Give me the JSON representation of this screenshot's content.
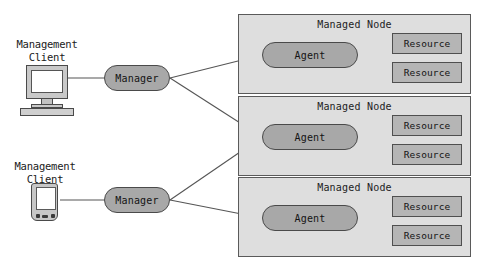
{
  "diagram": {
    "colors": {
      "node_fill": "#dedede",
      "node_border": "#5a5a5a",
      "pill_fill": "#a8a8a8",
      "pill_border": "#4a4a4a",
      "resource_fill": "#b5b5b5",
      "resource_border": "#4f4f4f",
      "line": "#555555",
      "text": "#141414",
      "background": "#ffffff"
    },
    "clients": [
      {
        "id": "management-client-desktop",
        "label": "Management\nClient",
        "device": "desktop-computer-icon"
      },
      {
        "id": "management-client-handheld",
        "label": "Management\nClient",
        "device": "pda-handheld-icon"
      }
    ],
    "managers": [
      {
        "id": "manager-top",
        "label": "Manager"
      },
      {
        "id": "manager-bottom",
        "label": "Manager"
      }
    ],
    "managed_nodes": [
      {
        "id": "managed-node-1",
        "title": "Managed Node",
        "agent": "Agent",
        "resources": [
          "Resource",
          "Resource"
        ]
      },
      {
        "id": "managed-node-2",
        "title": "Managed Node",
        "agent": "Agent",
        "resources": [
          "Resource",
          "Resource"
        ]
      },
      {
        "id": "managed-node-3",
        "title": "Managed Node",
        "agent": "Agent",
        "resources": [
          "Resource",
          "Resource"
        ]
      }
    ],
    "connections": [
      {
        "from": "management-client-desktop",
        "to": "manager-top"
      },
      {
        "from": "manager-top",
        "to": "managed-node-1"
      },
      {
        "from": "manager-top",
        "to": "managed-node-2"
      },
      {
        "from": "management-client-handheld",
        "to": "manager-bottom"
      },
      {
        "from": "manager-bottom",
        "to": "managed-node-2"
      },
      {
        "from": "manager-bottom",
        "to": "managed-node-3"
      },
      {
        "from": "managed-node-1.agent",
        "to": "managed-node-1.resource-1"
      },
      {
        "from": "managed-node-1.agent",
        "to": "managed-node-1.resource-2"
      },
      {
        "from": "managed-node-2.agent",
        "to": "managed-node-2.resource-1"
      },
      {
        "from": "managed-node-2.agent",
        "to": "managed-node-2.resource-2"
      },
      {
        "from": "managed-node-3.agent",
        "to": "managed-node-3.resource-1"
      },
      {
        "from": "managed-node-3.agent",
        "to": "managed-node-3.resource-2"
      }
    ]
  }
}
